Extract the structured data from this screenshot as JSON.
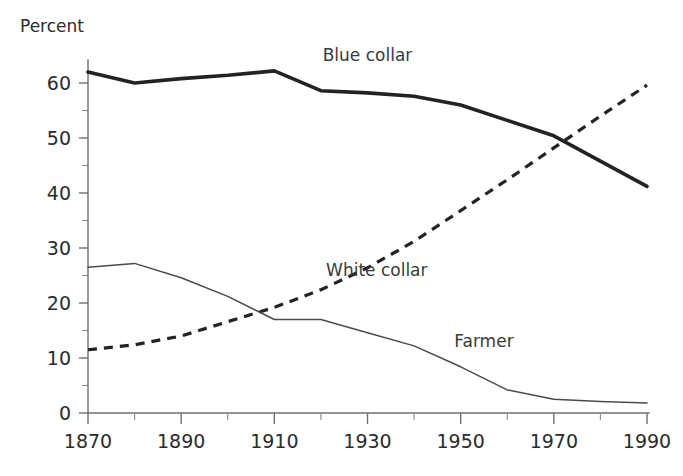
{
  "chart_data": {
    "type": "line",
    "title": "",
    "xlabel": "",
    "ylabel": "Percent",
    "xlim": [
      1870,
      1990
    ],
    "ylim": [
      0,
      65
    ],
    "grid": false,
    "legend_position": "inline-annotations",
    "x": [
      1870,
      1880,
      1890,
      1900,
      1910,
      1920,
      1930,
      1940,
      1950,
      1960,
      1970,
      1980,
      1990
    ],
    "x_tick_labels": [
      "1870",
      "1890",
      "1910",
      "1930",
      "1950",
      "1970",
      "1990"
    ],
    "x_tick_values": [
      1870,
      1890,
      1910,
      1930,
      1950,
      1970,
      1990
    ],
    "x_minor_ticks": [
      1880,
      1900,
      1920,
      1940,
      1960,
      1980
    ],
    "y_tick_labels": [
      "0",
      "10",
      "20",
      "30",
      "40",
      "50",
      "60"
    ],
    "y_tick_values": [
      0,
      10,
      20,
      30,
      40,
      50,
      60
    ],
    "y_minor_ticks": [
      5,
      15,
      25,
      35,
      45,
      55,
      65
    ],
    "series": [
      {
        "name": "Blue collar",
        "style": "thick-solid",
        "color": "#232323",
        "label_x": 1930,
        "label_y": 64,
        "values": [
          62.0,
          60.0,
          60.8,
          61.4,
          62.2,
          58.6,
          58.2,
          57.6,
          56.0,
          53.2,
          50.4,
          45.8,
          41.2
        ]
      },
      {
        "name": "White collar",
        "style": "dashed",
        "color": "#232323",
        "label_x": 1932,
        "label_y": 25,
        "values": [
          11.5,
          12.4,
          14.0,
          16.6,
          19.2,
          22.4,
          26.4,
          31.2,
          36.8,
          42.4,
          48.2,
          54.0,
          59.6
        ]
      },
      {
        "name": "Farmer",
        "style": "thin-solid",
        "color": "#4a4a4a",
        "label_x": 1955,
        "label_y": 12,
        "values": [
          26.5,
          27.2,
          24.6,
          21.2,
          17.0,
          17.0,
          14.6,
          12.2,
          8.4,
          4.2,
          2.5,
          2.1,
          1.8
        ]
      }
    ]
  },
  "axis": {
    "y_title": "Percent"
  }
}
